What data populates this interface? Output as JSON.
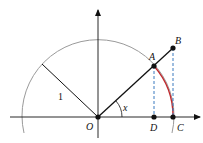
{
  "diagram": {
    "labels": {
      "O": "O",
      "A": "A",
      "B": "B",
      "C": "C",
      "D": "D",
      "angle": "x",
      "radius": "1"
    },
    "colors": {
      "circle": "#9a9a9a",
      "lines": "#111111",
      "arc": "#c0282d",
      "dashed": "#3a7bbf",
      "axes": "#111111"
    }
  }
}
